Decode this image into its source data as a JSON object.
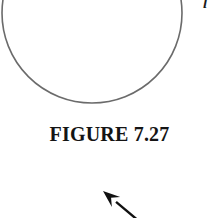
{
  "page": {
    "width": 219,
    "height": 218,
    "background_color": "#ffffff"
  },
  "figure": {
    "caption": "FIGURE 7.27",
    "caption_color": "#141414",
    "clipped_label": "l",
    "circle": {
      "center_x": 92,
      "center_y": 13,
      "radius": 90,
      "stroke_color": "#6b6b6b",
      "stroke_width": 1.6,
      "fill": "none",
      "note": "large circle clipped by top edge of crop"
    },
    "arrow": {
      "color": "#111111",
      "tip_x": 103,
      "tip_y": 191,
      "tail_x": 140,
      "tail_y": 222,
      "shaft_width": 2.4,
      "direction": "up-left",
      "note": "pointer arrow clipped by bottom edge of crop"
    }
  }
}
